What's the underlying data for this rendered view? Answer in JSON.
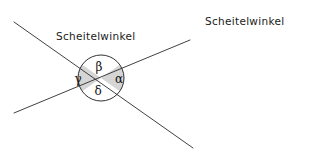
{
  "figure": {
    "title_labels": [
      {
        "id": "left",
        "text": "Scheitelwinkel"
      },
      {
        "id": "right",
        "text": "Scheitelwinkel"
      }
    ],
    "angles": [
      {
        "id": "beta",
        "symbol": "β",
        "position": "top",
        "shaded": false
      },
      {
        "id": "alpha",
        "symbol": "α",
        "position": "right",
        "shaded": true
      },
      {
        "id": "delta",
        "symbol": "δ",
        "position": "bottom",
        "shaded": false
      },
      {
        "id": "gamma",
        "symbol": "γ",
        "position": "left",
        "shaded": true
      }
    ],
    "geometry": {
      "center_x": 101,
      "center_y": 78,
      "radius": 23,
      "line_descending": {
        "x1": 14,
        "y1": 22,
        "x2": 193,
        "y2": 148
      },
      "line_ascending": {
        "x1": 14,
        "y1": 113,
        "x2": 190,
        "y2": 40
      }
    },
    "colors": {
      "background": "#ffffff",
      "line": "#2b2b2b",
      "circle_outline": "#1a1a1a",
      "sector_shade": "#d5d5d5",
      "text": "#1a1a1a"
    }
  }
}
